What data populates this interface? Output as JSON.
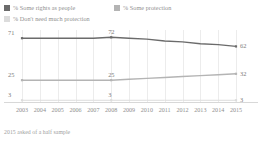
{
  "footnote": "2015 asked of a half sample",
  "legend": {
    "items": [
      {
        "label": "% Some rights as people",
        "color": "#6b6b6b",
        "icon": "legend-swatch-icon"
      },
      {
        "label": "% Some protection",
        "color": "#b4b4b4",
        "icon": "legend-swatch-icon"
      },
      {
        "label": "% Don't need much protection",
        "color": "#dcdcdc",
        "icon": "legend-swatch-icon"
      }
    ]
  },
  "chart_data": {
    "type": "line",
    "title": "",
    "xlabel": "",
    "ylabel": "",
    "grid": "vertical",
    "legend_position": "top",
    "ylim": [
      0,
      80
    ],
    "categories": [
      "2003",
      "2004",
      "2005",
      "2006",
      "2007",
      "2008",
      "2009",
      "2010",
      "2011",
      "2012",
      "2013",
      "2014",
      "2015"
    ],
    "series": [
      {
        "name": "% Some rights as people",
        "color": "#6b6b6b",
        "values": [
          71,
          71,
          71,
          71,
          71,
          72,
          71,
          70,
          68,
          67,
          65,
          64,
          62
        ],
        "labeled_points": [
          {
            "category": "2003",
            "value": 71
          },
          {
            "category": "2008",
            "value": 72
          },
          {
            "category": "2015",
            "value": 62
          }
        ]
      },
      {
        "name": "% Some protection",
        "color": "#b4b4b4",
        "values": [
          25,
          25,
          25,
          25,
          25,
          25,
          26,
          27,
          28,
          29,
          30,
          31,
          32
        ],
        "labeled_points": [
          {
            "category": "2003",
            "value": 25
          },
          {
            "category": "2008",
            "value": 25
          },
          {
            "category": "2015",
            "value": 32
          }
        ]
      },
      {
        "name": "% Don't need much protection",
        "color": "#dcdcdc",
        "values": [
          3,
          3,
          3,
          3,
          3,
          3,
          3,
          3,
          3,
          3,
          3,
          3,
          3
        ],
        "labeled_points": [
          {
            "category": "2003",
            "value": 3
          },
          {
            "category": "2008",
            "value": 3
          },
          {
            "category": "2015",
            "value": 3
          }
        ]
      }
    ]
  }
}
